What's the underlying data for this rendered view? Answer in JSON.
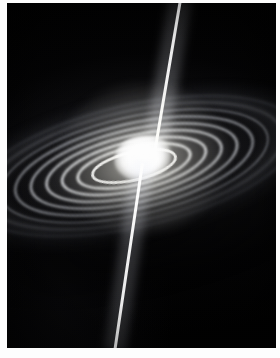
{
  "figure": {
    "kind": "astronomical-illustration",
    "caption": "",
    "background_color": "#000000",
    "plate_border_color": "#ffffff",
    "core_color": "#ffffff",
    "jet_color": "#ffffff",
    "disk_color": "#c8ccd6"
  },
  "plate": {
    "left": 7,
    "top": 3,
    "width": 269,
    "height": 345
  },
  "core": {
    "label": "central-source",
    "center_x": 143,
    "center_y": 158,
    "width": 58,
    "height": 46,
    "color": "#ffffff"
  },
  "jets": [
    {
      "name": "upper-jet",
      "from_x": 145,
      "from_y": 158,
      "to_x": 173,
      "to_y": 0,
      "color": "#ffffff"
    },
    {
      "name": "lower-jet",
      "from_x": 142,
      "from_y": 162,
      "to_x": 116,
      "to_y": 348,
      "color": "#ffffff"
    }
  ],
  "disk": {
    "name": "accretion-disk",
    "tilt_degrees": -13,
    "center_x": 135,
    "center_y": 162,
    "ring_count": 9,
    "major_axis": 336,
    "minor_axis": 124,
    "color": "#c8ccd6"
  },
  "starfield": {
    "name": "background-stars",
    "density": "sparse",
    "color": "#b4bac8"
  }
}
